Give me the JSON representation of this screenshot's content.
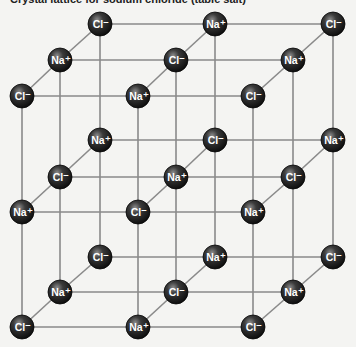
{
  "title": "Crystal lattice for sodium chloride (table salt)",
  "colors": {
    "background": "#f4f4f2",
    "edge": "#8a8a8a",
    "ion_dark": "#111111",
    "ion_highlight": "#8c8c8c",
    "label": "#ffffff"
  },
  "lattice": {
    "dimensions": [
      3,
      3,
      3
    ],
    "ion_radius": 12,
    "labels": {
      "Na": "Na⁺",
      "Cl": "Cl⁻"
    },
    "columns_x": {
      "back": [
        100,
        215,
        333
      ],
      "middle": [
        60,
        176,
        293
      ],
      "front": [
        22,
        138,
        253
      ]
    },
    "rows_y": {
      "top": {
        "back": 24,
        "middle": 60,
        "front": 96
      },
      "middle": {
        "back": 140,
        "middle": 177,
        "front": 212
      },
      "bottom": {
        "back": 257,
        "middle": 292,
        "front": 327
      }
    },
    "ions": [
      {
        "level": "top",
        "depth": "back",
        "col": 0,
        "type": "Cl",
        "x": 100,
        "y": 24
      },
      {
        "level": "top",
        "depth": "back",
        "col": 1,
        "type": "Na",
        "x": 215,
        "y": 24
      },
      {
        "level": "top",
        "depth": "back",
        "col": 2,
        "type": "Cl",
        "x": 333,
        "y": 24
      },
      {
        "level": "top",
        "depth": "middle",
        "col": 0,
        "type": "Na",
        "x": 60,
        "y": 60
      },
      {
        "level": "top",
        "depth": "middle",
        "col": 1,
        "type": "Cl",
        "x": 176,
        "y": 60
      },
      {
        "level": "top",
        "depth": "middle",
        "col": 2,
        "type": "Na",
        "x": 293,
        "y": 60
      },
      {
        "level": "top",
        "depth": "front",
        "col": 0,
        "type": "Cl",
        "x": 22,
        "y": 96
      },
      {
        "level": "top",
        "depth": "front",
        "col": 1,
        "type": "Na",
        "x": 138,
        "y": 96
      },
      {
        "level": "top",
        "depth": "front",
        "col": 2,
        "type": "Cl",
        "x": 253,
        "y": 96
      },
      {
        "level": "middle",
        "depth": "back",
        "col": 0,
        "type": "Na",
        "x": 100,
        "y": 140
      },
      {
        "level": "middle",
        "depth": "back",
        "col": 1,
        "type": "Cl",
        "x": 215,
        "y": 140
      },
      {
        "level": "middle",
        "depth": "back",
        "col": 2,
        "type": "Na",
        "x": 333,
        "y": 140
      },
      {
        "level": "middle",
        "depth": "middle",
        "col": 0,
        "type": "Cl",
        "x": 60,
        "y": 177
      },
      {
        "level": "middle",
        "depth": "middle",
        "col": 1,
        "type": "Na",
        "x": 176,
        "y": 177
      },
      {
        "level": "middle",
        "depth": "middle",
        "col": 2,
        "type": "Cl",
        "x": 293,
        "y": 177
      },
      {
        "level": "middle",
        "depth": "front",
        "col": 0,
        "type": "Na",
        "x": 22,
        "y": 212
      },
      {
        "level": "middle",
        "depth": "front",
        "col": 1,
        "type": "Cl",
        "x": 138,
        "y": 212
      },
      {
        "level": "middle",
        "depth": "front",
        "col": 2,
        "type": "Na",
        "x": 253,
        "y": 212
      },
      {
        "level": "bottom",
        "depth": "back",
        "col": 0,
        "type": "Cl",
        "x": 100,
        "y": 257
      },
      {
        "level": "bottom",
        "depth": "back",
        "col": 1,
        "type": "Na",
        "x": 215,
        "y": 257
      },
      {
        "level": "bottom",
        "depth": "back",
        "col": 2,
        "type": "Cl",
        "x": 333,
        "y": 257
      },
      {
        "level": "bottom",
        "depth": "middle",
        "col": 0,
        "type": "Na",
        "x": 60,
        "y": 292
      },
      {
        "level": "bottom",
        "depth": "middle",
        "col": 1,
        "type": "Cl",
        "x": 176,
        "y": 292
      },
      {
        "level": "bottom",
        "depth": "middle",
        "col": 2,
        "type": "Na",
        "x": 293,
        "y": 292
      },
      {
        "level": "bottom",
        "depth": "front",
        "col": 0,
        "type": "Cl",
        "x": 22,
        "y": 327
      },
      {
        "level": "bottom",
        "depth": "front",
        "col": 1,
        "type": "Na",
        "x": 138,
        "y": 327
      },
      {
        "level": "bottom",
        "depth": "front",
        "col": 2,
        "type": "Cl",
        "x": 253,
        "y": 327
      }
    ]
  }
}
